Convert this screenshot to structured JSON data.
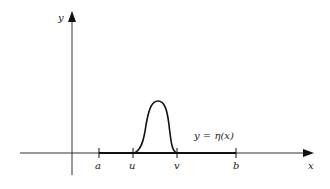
{
  "diagram": {
    "type": "function-graph",
    "axes": {
      "x_label": "x",
      "y_label": "y"
    },
    "ticks": [
      {
        "label": "a"
      },
      {
        "label": "u"
      },
      {
        "label": "v"
      },
      {
        "label": "b"
      }
    ],
    "curve_label": "y = η(x)",
    "colors": {
      "ink": "#222222",
      "background": "#ffffff"
    }
  }
}
